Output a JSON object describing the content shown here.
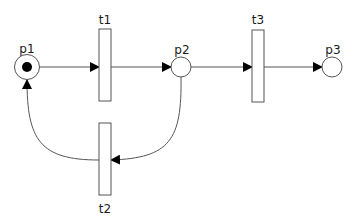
{
  "diagram": {
    "type": "petri-net",
    "colors": {
      "stroke": "#555555",
      "arrow": "#000000",
      "token": "#000000",
      "fill": "#ffffff"
    },
    "places": [
      {
        "id": "p1",
        "label": "p1",
        "tokens": 1
      },
      {
        "id": "p2",
        "label": "p2",
        "tokens": 0
      },
      {
        "id": "p3",
        "label": "p3",
        "tokens": 0
      }
    ],
    "transitions": [
      {
        "id": "t1",
        "label": "t1"
      },
      {
        "id": "t2",
        "label": "t2"
      },
      {
        "id": "t3",
        "label": "t3"
      }
    ],
    "arcs": [
      {
        "from": "p1",
        "to": "t1"
      },
      {
        "from": "t1",
        "to": "p2"
      },
      {
        "from": "p2",
        "to": "t3"
      },
      {
        "from": "t3",
        "to": "p3"
      },
      {
        "from": "p2",
        "to": "t2"
      },
      {
        "from": "t2",
        "to": "p1"
      }
    ]
  }
}
